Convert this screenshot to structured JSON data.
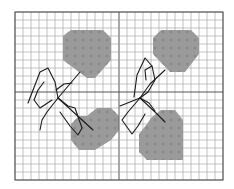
{
  "diagram": {
    "type": "cross-stitch-pattern",
    "colors": {
      "background": "#ffffff",
      "grid_line": "#9a9a9a",
      "grid_major": "#555555",
      "border": "#444444",
      "fill": "#9b9b9b",
      "symbol": "#7a7a7a",
      "backstitch": "#1a1a1a"
    },
    "grid": {
      "x0": 15,
      "y0": 12,
      "cols": 26,
      "rows": 21,
      "cell": 8,
      "major_col": 13,
      "major_row": 10
    },
    "hearts": [
      {
        "name": "heart-top-left",
        "points": [
          [
            63,
            36
          ],
          [
            71,
            30
          ],
          [
            103,
            30
          ],
          [
            111,
            38
          ],
          [
            111,
            60
          ],
          [
            95,
            78
          ],
          [
            87,
            78
          ],
          [
            63,
            60
          ]
        ]
      },
      {
        "name": "heart-top-right",
        "points": [
          [
            153,
            38
          ],
          [
            161,
            30
          ],
          [
            191,
            30
          ],
          [
            199,
            38
          ],
          [
            199,
            54
          ],
          [
            185,
            72
          ],
          [
            170,
            72
          ],
          [
            153,
            54
          ]
        ]
      },
      {
        "name": "heart-bottom-left",
        "points": [
          [
            71,
            124
          ],
          [
            71,
            140
          ],
          [
            79,
            150
          ],
          [
            95,
            150
          ],
          [
            111,
            140
          ],
          [
            119,
            130
          ],
          [
            119,
            116
          ],
          [
            111,
            108
          ],
          [
            97,
            108
          ],
          [
            87,
            116
          ],
          [
            79,
            116
          ]
        ]
      },
      {
        "name": "heart-bottom-right",
        "points": [
          [
            139,
            134
          ],
          [
            139,
            152
          ],
          [
            147,
            160
          ],
          [
            183,
            160
          ],
          [
            183,
            120
          ],
          [
            175,
            110
          ],
          [
            161,
            110
          ],
          [
            151,
            118
          ],
          [
            147,
            124
          ]
        ]
      }
    ],
    "bows": [
      {
        "name": "bow-left",
        "paths": [
          "M28,103 L40,72 L48,68 L55,82 L58,98",
          "M58,98 L47,112 L42,120 L40,130",
          "M58,98 L68,106 L75,108 L82,128 L78,135 L70,126 L60,112",
          "M58,98 L80,72",
          "M58,98 L93,130",
          "M56,90 L64,84 L72,83",
          "M44,82 L38,90 L34,100 L40,108 L52,100"
        ]
      },
      {
        "name": "bow-right",
        "paths": [
          "M134,97 L137,75 L145,58 L152,66 L155,80 L148,92 L140,98",
          "M140,98 L128,112 L122,120 L132,134 L138,126 L145,114",
          "M140,98 L150,84 L165,70",
          "M140,98 L155,112 L165,122",
          "M140,98 L149,103 L155,111",
          "M146,80 L145,70 L152,66",
          "M140,98 L120,106"
        ]
      }
    ]
  }
}
